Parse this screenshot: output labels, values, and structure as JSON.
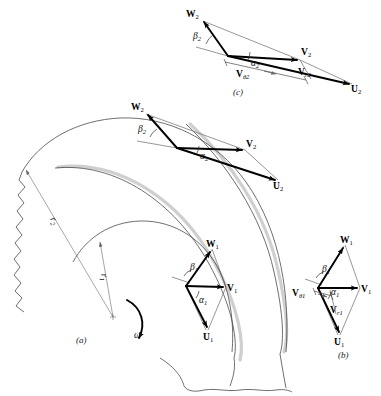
{
  "figure": {
    "panels": [
      {
        "id": "a",
        "label": "(a)",
        "caption": "impeller with blades and velocity triangles"
      },
      {
        "id": "b",
        "label": "(b)",
        "caption": "inlet velocity triangle"
      },
      {
        "id": "c",
        "label": "(c)",
        "caption": "outlet velocity triangle"
      }
    ]
  },
  "colors": {
    "background": "#ffffff",
    "blade_line": "#4a4a4a",
    "blade_shadow": "#cfcfcf",
    "vector_heavy": "#000000",
    "vector_light": "#5e5e5e",
    "text": "#111111"
  },
  "panel_a": {
    "label": "(a)",
    "rotation_symbol": "ω",
    "radius_labels": [
      {
        "name": "r2",
        "base": "r",
        "sub": "2"
      },
      {
        "name": "r1",
        "base": "r",
        "sub": "1"
      }
    ],
    "outlet_triangle": {
      "relative_velocity": {
        "base": "W",
        "sub": "2"
      },
      "absolute_velocity": {
        "base": "V",
        "sub": "2"
      },
      "blade_velocity": {
        "base": "U",
        "sub": "2"
      },
      "blade_angle": {
        "base": "β",
        "sub": "2"
      },
      "flow_angle": {
        "base": "α",
        "sub": "2"
      }
    },
    "inlet_triangle": {
      "relative_velocity": {
        "base": "W",
        "sub": "1"
      },
      "absolute_velocity": {
        "base": "V",
        "sub": "1"
      },
      "blade_velocity": {
        "base": "U",
        "sub": "1"
      },
      "blade_angle": {
        "base": "β",
        "sub": "1"
      },
      "flow_angle": {
        "base": "α",
        "sub": "1"
      }
    }
  },
  "panel_b": {
    "label": "(b)",
    "relative_velocity": {
      "base": "W",
      "sub": "1"
    },
    "absolute_velocity": {
      "base": "V",
      "sub": "1"
    },
    "blade_velocity": {
      "base": "U",
      "sub": "1"
    },
    "tangential_component": {
      "base": "V",
      "sub": "θ1"
    },
    "radial_component": {
      "base": "V",
      "sub": "r1"
    },
    "blade_angle": {
      "base": "β",
      "sub": "1"
    },
    "flow_angle": {
      "base": "α",
      "sub": "1"
    }
  },
  "panel_c": {
    "label": "(c)",
    "relative_velocity": {
      "base": "W",
      "sub": "2"
    },
    "absolute_velocity": {
      "base": "V",
      "sub": "2"
    },
    "blade_velocity": {
      "base": "U",
      "sub": "2"
    },
    "tangential_component": {
      "base": "V",
      "sub": "θ2"
    },
    "radial_component": {
      "base": "V",
      "sub": "r2"
    },
    "blade_angle": {
      "base": "β",
      "sub": "2"
    },
    "flow_angle": {
      "base": "α",
      "sub": "2"
    }
  }
}
